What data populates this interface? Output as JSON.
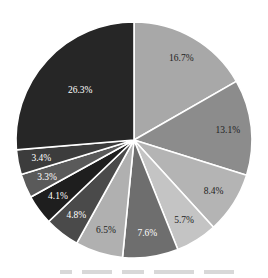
{
  "chart_data": {
    "type": "pie",
    "title": "",
    "start": "12 o'clock",
    "direction": "clockwise",
    "slices": [
      {
        "label": "16.7%",
        "value": 16.7,
        "color": "#a8a8a8",
        "text_color": "#222222"
      },
      {
        "label": "13.1%",
        "value": 13.1,
        "color": "#8c8c8c",
        "text_color": "#222222"
      },
      {
        "label": "8.4%",
        "value": 8.4,
        "color": "#b4b4b4",
        "text_color": "#222222"
      },
      {
        "label": "5.7%",
        "value": 5.7,
        "color": "#c4c4c4",
        "text_color": "#222222"
      },
      {
        "label": "7.6%",
        "value": 7.6,
        "color": "#6e6e6e",
        "text_color": "#ffffff"
      },
      {
        "label": "6.5%",
        "value": 6.5,
        "color": "#b0b0b0",
        "text_color": "#222222"
      },
      {
        "label": "4.8%",
        "value": 4.8,
        "color": "#4a4a4a",
        "text_color": "#ffffff"
      },
      {
        "label": "4.1%",
        "value": 4.1,
        "color": "#1e1e1e",
        "text_color": "#ffffff"
      },
      {
        "label": "3.3%",
        "value": 3.3,
        "color": "#5a5a5a",
        "text_color": "#ffffff"
      },
      {
        "label": "3.4%",
        "value": 3.4,
        "color": "#3c3c3c",
        "text_color": "#ffffff"
      },
      {
        "label": "26.3%",
        "value": 26.3,
        "color": "#262626",
        "text_color": "#ffffff"
      }
    ]
  }
}
